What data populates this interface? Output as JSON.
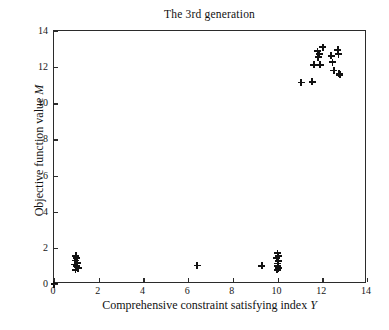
{
  "chart_data": {
    "type": "scatter",
    "title": "The 3rd generation",
    "xlabel": "Comprehensive constraint satisfying index Y",
    "xlabel_text": "Comprehensive constraint satisfying index ",
    "xlabel_var": "Y",
    "ylabel": "Objective function value M",
    "ylabel_text": "Objective function value ",
    "ylabel_var": "M",
    "xlim": [
      0,
      14
    ],
    "ylim": [
      0,
      14
    ],
    "xticks": [
      0,
      2,
      4,
      6,
      8,
      10,
      12,
      14
    ],
    "yticks": [
      0,
      2,
      4,
      6,
      8,
      10,
      12,
      14
    ],
    "xticklabels": [
      "0",
      "2",
      "4",
      "6",
      "8",
      "10",
      "12",
      "14"
    ],
    "yticklabels": [
      "0",
      "2",
      "4",
      "6",
      "8",
      "10",
      "12",
      "14"
    ],
    "grid": false,
    "legend": null,
    "marker": "+",
    "marker_color": "#111111",
    "series": [
      {
        "name": "population",
        "points": [
          [
            0.98,
            1.55
          ],
          [
            1.02,
            1.42
          ],
          [
            0.95,
            1.3
          ],
          [
            1.05,
            1.18
          ],
          [
            0.92,
            1.08
          ],
          [
            1.0,
            0.98
          ],
          [
            1.08,
            0.88
          ],
          [
            0.96,
            0.78
          ],
          [
            6.4,
            1.02
          ],
          [
            9.3,
            1.0
          ],
          [
            10.0,
            1.7
          ],
          [
            10.02,
            1.56
          ],
          [
            9.97,
            1.42
          ],
          [
            10.04,
            1.28
          ],
          [
            9.99,
            1.14
          ],
          [
            10.01,
            1.0
          ],
          [
            10.03,
            0.88
          ],
          [
            9.98,
            0.78
          ],
          [
            11.05,
            11.15
          ],
          [
            11.55,
            11.18
          ],
          [
            11.62,
            12.12
          ],
          [
            11.9,
            12.12
          ],
          [
            11.82,
            12.55
          ],
          [
            11.86,
            12.72
          ],
          [
            11.78,
            12.88
          ],
          [
            12.02,
            13.1
          ],
          [
            12.4,
            12.62
          ],
          [
            12.45,
            12.28
          ],
          [
            12.52,
            11.82
          ],
          [
            12.7,
            12.95
          ],
          [
            12.72,
            12.72
          ],
          [
            12.75,
            11.65
          ],
          [
            12.78,
            11.58
          ]
        ]
      }
    ]
  }
}
